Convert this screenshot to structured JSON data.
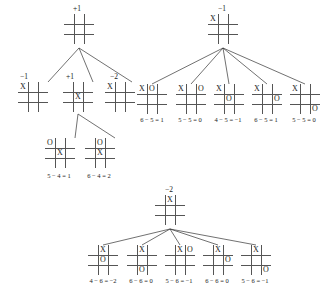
{
  "figure": {
    "caption": "",
    "mark_x": "X",
    "mark_o": "O",
    "empty": ""
  },
  "trees": [
    {
      "id": "tree-root",
      "root": {
        "label": "+1",
        "cells": [
          "",
          "",
          "",
          "",
          "",
          "",
          "",
          "",
          ""
        ]
      },
      "level2": [
        {
          "label": "−1",
          "cells": [
            "X",
            "",
            "",
            "",
            "",
            "",
            "",
            "",
            ""
          ]
        },
        {
          "label": "+1",
          "cells": [
            "",
            "",
            "",
            "",
            "X",
            "",
            "",
            "",
            ""
          ]
        },
        {
          "label": "−2",
          "cells": [
            "X",
            "",
            "",
            "",
            "",
            "",
            "",
            "",
            ""
          ]
        }
      ],
      "level3": [
        {
          "score": "5 − 4 = 1",
          "cells": [
            "O",
            "",
            "",
            "",
            "X",
            "",
            "",
            "",
            ""
          ]
        },
        {
          "score": "6 − 4 = 2",
          "cells": [
            "",
            "O",
            "",
            "",
            "X",
            "",
            "",
            "",
            ""
          ]
        }
      ]
    },
    {
      "id": "tree-minus-one",
      "root": {
        "label": "−1",
        "cells": [
          "X",
          "",
          "",
          "",
          "",
          "",
          "",
          "",
          ""
        ]
      },
      "children": [
        {
          "score": "6 − 5 = 1",
          "cells": [
            "X",
            "O",
            "",
            "",
            "",
            "",
            "",
            "",
            ""
          ]
        },
        {
          "score": "5 − 5 = 0",
          "cells": [
            "X",
            "",
            "O",
            "",
            "",
            "",
            "",
            "",
            ""
          ]
        },
        {
          "score": "4 − 5 = −1",
          "cells": [
            "X",
            "",
            "",
            "",
            "O",
            "",
            "",
            "",
            ""
          ]
        },
        {
          "score": "6 − 5 = 1",
          "cells": [
            "X",
            "",
            "",
            "",
            "",
            "O",
            "",
            "",
            ""
          ]
        },
        {
          "score": "5 − 5 = 0",
          "cells": [
            "X",
            "",
            "",
            "",
            "",
            "",
            "",
            "",
            "O"
          ]
        }
      ]
    },
    {
      "id": "tree-minus-two",
      "root": {
        "label": "−2",
        "cells": [
          "",
          "X",
          "",
          "",
          "",
          "",
          "",
          "",
          ""
        ]
      },
      "children": [
        {
          "score": "4 − 6 = −2",
          "cells": [
            "",
            "X",
            "",
            "",
            "O",
            "",
            "",
            "",
            ""
          ]
        },
        {
          "score": "6 − 6 = 0",
          "cells": [
            "",
            "X",
            "",
            "",
            "",
            "",
            "",
            "O",
            ""
          ]
        },
        {
          "score": "5 − 6 = −1",
          "cells": [
            "",
            "X",
            "O",
            "",
            "",
            "",
            "",
            "",
            ""
          ]
        },
        {
          "score": "6 − 6 = 0",
          "cells": [
            "",
            "X",
            "",
            "",
            "",
            "O",
            "",
            "",
            ""
          ]
        },
        {
          "score": "5 − 6 = −1",
          "cells": [
            "",
            "X",
            "",
            "",
            "",
            "",
            "",
            "",
            "O"
          ]
        }
      ]
    }
  ],
  "layout": {
    "tree_root": {
      "root_pos": [
        64,
        14
      ],
      "root_label_pos": [
        73,
        5
      ],
      "level2_pos": [
        [
          18,
          82
        ],
        [
          63,
          82
        ],
        [
          105,
          82
        ]
      ],
      "level2_label_pos": [
        [
          20,
          73
        ],
        [
          66,
          73
        ],
        [
          110,
          73
        ]
      ],
      "level3_pos": [
        [
          45,
          138
        ],
        [
          85,
          138
        ]
      ],
      "score_pos": [
        [
          35,
          172
        ],
        [
          75,
          172
        ]
      ],
      "edges": [
        [
          79,
          48,
          33,
          82
        ],
        [
          79,
          48,
          78,
          82
        ],
        [
          79,
          48,
          117,
          82
        ],
        [
          78,
          114,
          60,
          138
        ],
        [
          78,
          114,
          100,
          138
        ]
      ]
    },
    "tree_minus_one": {
      "root_pos": [
        208,
        14
      ],
      "root_label_pos": [
        218,
        5
      ],
      "children_pos": [
        [
          137,
          84
        ],
        [
          176,
          84
        ],
        [
          214,
          84
        ],
        [
          252,
          84
        ],
        [
          290,
          84
        ]
      ],
      "score_pos": [
        [
          128,
          116
        ],
        [
          166,
          116
        ],
        [
          204,
          116
        ],
        [
          242,
          116
        ],
        [
          280,
          116
        ]
      ],
      "edges": [
        [
          223,
          48,
          147,
          84
        ],
        [
          223,
          48,
          186,
          84
        ],
        [
          223,
          48,
          224,
          84
        ],
        [
          223,
          48,
          262,
          84
        ],
        [
          223,
          48,
          300,
          84
        ]
      ]
    },
    "tree_minus_two": {
      "root_pos": [
        155,
        195
      ],
      "root_label_pos": [
        165,
        186
      ],
      "children_pos": [
        [
          88,
          245
        ],
        [
          127,
          245
        ],
        [
          165,
          245
        ],
        [
          203,
          245
        ],
        [
          241,
          245
        ]
      ],
      "score_pos": [
        [
          79,
          277
        ],
        [
          117,
          277
        ],
        [
          155,
          277
        ],
        [
          193,
          277
        ],
        [
          231,
          277
        ]
      ],
      "edges": [
        [
          170,
          229,
          98,
          245
        ],
        [
          170,
          229,
          137,
          245
        ],
        [
          170,
          229,
          175,
          245
        ],
        [
          170,
          229,
          213,
          245
        ],
        [
          170,
          229,
          251,
          245
        ]
      ]
    }
  }
}
